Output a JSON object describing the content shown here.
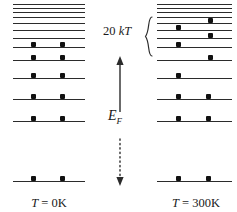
{
  "figure": {
    "ink_color": "#2b2b2b",
    "dot_color": "#111111",
    "background": "#ffffff"
  },
  "center": {
    "fermi_label": "E",
    "fermi_subscript": "F",
    "energy_gap_label": "20 kT",
    "energy_gap_value": 20,
    "energy_gap_unit": "kT",
    "arrow_solid_top": 56,
    "arrow_dotted_bottom": 186,
    "arrow_x": 120
  },
  "panels": [
    {
      "id": "left",
      "label_prefix": "T",
      "label_equals": "=",
      "label_value": "0K",
      "label_full": "T = 0K",
      "temperature_k": 0,
      "x": 13,
      "width": 72,
      "label_x": 49,
      "label_y": 196,
      "levels": [
        {
          "y": 4,
          "weight": "thin",
          "dots": []
        },
        {
          "y": 8,
          "weight": "thin",
          "dots": []
        },
        {
          "y": 12,
          "weight": "thin",
          "dots": []
        },
        {
          "y": 17,
          "weight": "thin",
          "dots": []
        },
        {
          "y": 23,
          "weight": "thin",
          "dots": []
        },
        {
          "y": 30,
          "weight": "thin",
          "dots": []
        },
        {
          "y": 38,
          "weight": "thin",
          "dots": []
        },
        {
          "y": 47,
          "weight": "bold",
          "dots": [
            0.28,
            0.69
          ]
        },
        {
          "y": 60,
          "weight": "bold",
          "dots": [
            0.28,
            0.69
          ]
        },
        {
          "y": 78,
          "weight": "bold",
          "dots": [
            0.28,
            0.69
          ]
        },
        {
          "y": 99,
          "weight": "bold",
          "dots": [
            0.28,
            0.69
          ]
        },
        {
          "y": 121,
          "weight": "bold",
          "dots": [
            0.28,
            0.69
          ]
        },
        {
          "y": 181,
          "weight": "bold",
          "dots": [
            0.28,
            0.69
          ]
        }
      ]
    },
    {
      "id": "right",
      "label_prefix": "T",
      "label_equals": "=",
      "label_value": "300K",
      "label_full": "T = 300K",
      "temperature_k": 300,
      "x": 157,
      "width": 75,
      "label_x": 196,
      "label_y": 196,
      "levels": [
        {
          "y": 4,
          "weight": "thin",
          "dots": []
        },
        {
          "y": 8,
          "weight": "thin",
          "dots": []
        },
        {
          "y": 12,
          "weight": "thin",
          "dots": []
        },
        {
          "y": 17,
          "weight": "thin",
          "dots": []
        },
        {
          "y": 23,
          "weight": "thin",
          "dots": [
            0.71
          ]
        },
        {
          "y": 30,
          "weight": "thin",
          "dots": [
            0.28
          ]
        },
        {
          "y": 38,
          "weight": "thin",
          "dots": [
            0.71
          ]
        },
        {
          "y": 47,
          "weight": "bold",
          "dots": [
            0.28
          ]
        },
        {
          "y": 60,
          "weight": "bold",
          "dots": [
            0.71
          ]
        },
        {
          "y": 78,
          "weight": "bold",
          "dots": [
            0.28
          ]
        },
        {
          "y": 99,
          "weight": "bold",
          "dots": [
            0.28,
            0.69
          ]
        },
        {
          "y": 121,
          "weight": "bold",
          "dots": [
            0.28,
            0.69
          ]
        },
        {
          "y": 181,
          "weight": "bold",
          "dots": [
            0.28,
            0.69
          ]
        }
      ]
    }
  ],
  "brace": {
    "x": 146,
    "top": 17,
    "bottom": 56,
    "label_x": 104,
    "label_y": 30
  }
}
